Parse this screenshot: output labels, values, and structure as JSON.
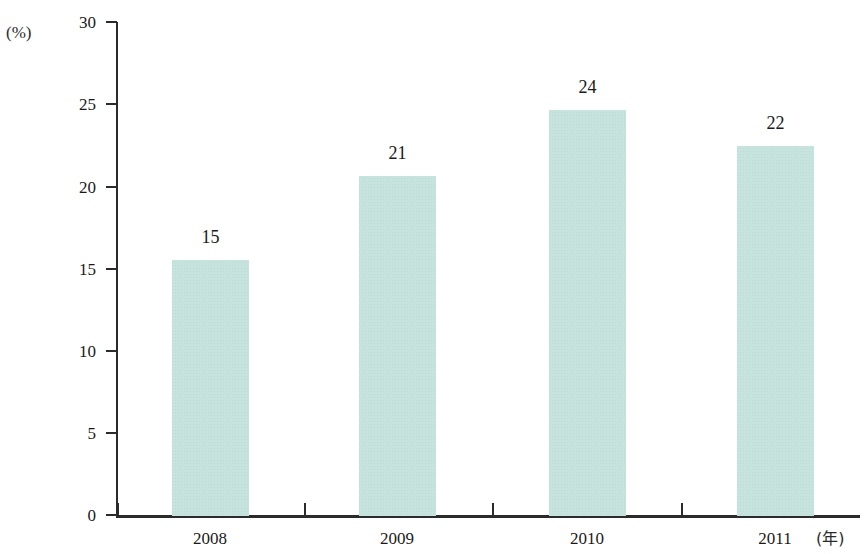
{
  "chart_data": {
    "type": "bar",
    "title": "",
    "subtitle": "",
    "xlabel": "(年)",
    "ylabel": "(%)",
    "categories": [
      "2008",
      "2009",
      "2010",
      "2011"
    ],
    "values": [
      15.5,
      20.6,
      24.6,
      22.4
    ],
    "data_labels": [
      "15",
      "21",
      "24",
      "22"
    ],
    "series": [
      {
        "name": "",
        "values": [
          15.5,
          20.6,
          24.6,
          22.4
        ],
        "color": "#c6e3dd"
      }
    ],
    "ylim": [
      0,
      30
    ],
    "yticks": [
      0,
      5,
      10,
      15,
      20,
      25,
      30
    ],
    "ytick_labels": [
      "0",
      "5",
      "10",
      "15",
      "20",
      "25",
      "30"
    ],
    "grid": false,
    "legend": false,
    "bar_color": "#c6e3dd",
    "axis_color": "#2b2b2b"
  },
  "axes": {
    "y_unit": "(%)",
    "x_unit": "(年)",
    "ticks_y": [
      {
        "label": "30",
        "top": 22
      },
      {
        "label": "25",
        "top": 104
      },
      {
        "label": "20",
        "top": 187
      },
      {
        "label": "15",
        "top": 269
      },
      {
        "label": "10",
        "top": 351
      },
      {
        "label": "5",
        "top": 433
      },
      {
        "label": "0",
        "top": 515
      }
    ],
    "ticks_x": [
      {
        "label": "2008",
        "center": 210,
        "tick": 117
      },
      {
        "label": "2009",
        "center": 397,
        "tick": 304
      },
      {
        "label": "2010",
        "center": 587,
        "tick": 492
      },
      {
        "label": "2011",
        "center": 775,
        "tick": 681
      }
    ]
  },
  "bars": [
    {
      "label": "15",
      "left": 172,
      "width": 77,
      "top": 260,
      "height": 256,
      "label_top": 228
    },
    {
      "label": "21",
      "left": 359,
      "width": 77,
      "top": 176,
      "height": 340,
      "label_top": 144
    },
    {
      "label": "24",
      "left": 549,
      "width": 77,
      "top": 110,
      "height": 406,
      "label_top": 78
    },
    {
      "label": "22",
      "left": 737,
      "width": 77,
      "top": 146,
      "height": 370,
      "label_top": 114
    }
  ]
}
